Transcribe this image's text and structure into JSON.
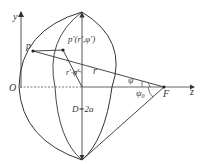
{
  "diagram": {
    "colors": {
      "stroke": "#333333",
      "background": "#ffffff"
    },
    "axes": {
      "y_label": "y",
      "z_label": "z",
      "origin_label": "O"
    },
    "points": {
      "p_label": "p",
      "p_prime_label": "p′(r′,φ′)",
      "focus_label": "F"
    },
    "labels": {
      "r_prime_phi": "r′·φ′",
      "r": "r",
      "psi": "ψ",
      "psi0": "ψ",
      "psi0_sub": "0",
      "diameter": "D=2a"
    }
  }
}
